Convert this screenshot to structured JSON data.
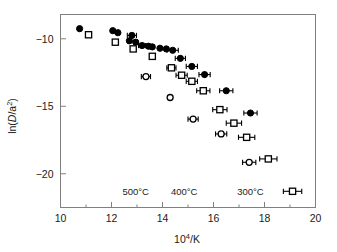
{
  "figure": {
    "background": "#ffffff",
    "frame_color": "#808080",
    "marker_color": "#000000"
  },
  "chart_data": {
    "type": "scatter",
    "title": "",
    "xlabel": "10⁴/K",
    "ylabel": "ln(D/a²)",
    "xlim": [
      10,
      20
    ],
    "ylim": [
      -22.5,
      -8.2
    ],
    "xticks": [
      10,
      12,
      14,
      16,
      18,
      20
    ],
    "xtick_labels": [
      "10",
      "12",
      "14",
      "16",
      "18",
      "20"
    ],
    "xminor_ticks": [
      11,
      13,
      15,
      17,
      19
    ],
    "yticks": [
      -10,
      -15,
      -20
    ],
    "ytick_labels": [
      "−10",
      "−15",
      "−20"
    ],
    "grid": false,
    "legend": null,
    "annotations": [
      {
        "text": "500°C",
        "x": 12.95,
        "y": -21.6
      },
      {
        "text": "400°C",
        "x": 14.85,
        "y": -21.6
      },
      {
        "text": "300°C",
        "x": 17.45,
        "y": -21.6
      }
    ],
    "series": [
      {
        "name": "filled-circle-series",
        "marker": "filled-circle",
        "points": [
          {
            "x": 10.75,
            "y": -9.25,
            "xerr": 0.0
          },
          {
            "x": 12.05,
            "y": -9.4,
            "xerr": 0.0
          },
          {
            "x": 12.25,
            "y": -9.55,
            "xerr": 0.0
          },
          {
            "x": 12.8,
            "y": -9.75,
            "xerr": 0.18
          },
          {
            "x": 12.7,
            "y": -10.15,
            "xerr": 0.0
          },
          {
            "x": 12.95,
            "y": -10.25,
            "xerr": 0.0
          },
          {
            "x": 13.2,
            "y": -10.5,
            "xerr": 0.14
          },
          {
            "x": 13.45,
            "y": -10.55,
            "xerr": 0.0
          },
          {
            "x": 13.6,
            "y": -10.6,
            "xerr": 0.0
          },
          {
            "x": 13.9,
            "y": -10.7,
            "xerr": 0.0
          },
          {
            "x": 14.15,
            "y": -10.75,
            "xerr": 0.0
          },
          {
            "x": 14.4,
            "y": -10.85,
            "xerr": 0.22
          },
          {
            "x": 14.7,
            "y": -11.45,
            "xerr": 0.2
          },
          {
            "x": 15.15,
            "y": -12.05,
            "xerr": 0.22
          },
          {
            "x": 15.65,
            "y": -12.65,
            "xerr": 0.22
          },
          {
            "x": 16.5,
            "y": -13.85,
            "xerr": 0.26
          },
          {
            "x": 17.45,
            "y": -15.5,
            "xerr": 0.26
          }
        ]
      },
      {
        "name": "open-square-series",
        "marker": "open-square",
        "points": [
          {
            "x": 11.1,
            "y": -9.7,
            "xerr": 0.0
          },
          {
            "x": 12.15,
            "y": -10.25,
            "xerr": 0.0
          },
          {
            "x": 12.85,
            "y": -10.75,
            "xerr": 0.0
          },
          {
            "x": 13.6,
            "y": -11.3,
            "xerr": 0.0
          },
          {
            "x": 14.35,
            "y": -12.15,
            "xerr": 0.18
          },
          {
            "x": 14.75,
            "y": -12.7,
            "xerr": 0.22
          },
          {
            "x": 15.15,
            "y": -13.15,
            "xerr": 0.22
          },
          {
            "x": 15.6,
            "y": -13.85,
            "xerr": 0.26
          },
          {
            "x": 16.25,
            "y": -15.25,
            "xerr": 0.28
          },
          {
            "x": 16.8,
            "y": -16.25,
            "xerr": 0.3
          },
          {
            "x": 17.3,
            "y": -17.3,
            "xerr": 0.32
          },
          {
            "x": 18.15,
            "y": -18.9,
            "xerr": 0.34
          },
          {
            "x": 19.1,
            "y": -21.3,
            "xerr": 0.36
          }
        ]
      },
      {
        "name": "open-circle-series",
        "marker": "open-circle",
        "points": [
          {
            "x": 13.35,
            "y": -12.8,
            "xerr": 0.18
          },
          {
            "x": 14.3,
            "y": -14.35,
            "xerr": 0.0
          },
          {
            "x": 15.2,
            "y": -15.95,
            "xerr": 0.2
          },
          {
            "x": 16.3,
            "y": -17.05,
            "xerr": 0.22
          },
          {
            "x": 17.4,
            "y": -19.15,
            "xerr": 0.26
          }
        ]
      }
    ]
  }
}
